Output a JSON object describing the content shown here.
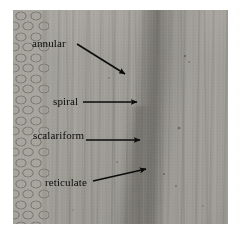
{
  "figure": {
    "kind": "light-micrograph",
    "plate": {
      "left": 13,
      "top": 10,
      "width": 215,
      "height": 214,
      "background_color": "#ffffff",
      "tissue_tone": "#a09e98",
      "dark_band_tone": "#58564f"
    },
    "annotations": {
      "ink_color": "#0b0b0b",
      "callouts": [
        {
          "id": "annular",
          "label": "annular",
          "label_x": 32,
          "label_y": 38,
          "arrow_style": "diagonal-down-right",
          "arrow_start_x": 77,
          "arrow_start_y": 44,
          "arrow_tip_x": 126,
          "arrow_tip_y": 75
        },
        {
          "id": "spiral",
          "label": "spiral",
          "label_x": 53,
          "label_y": 96,
          "arrow_style": "horizontal-right",
          "arrow_start_x": 83,
          "arrow_start_y": 102,
          "arrow_tip_x": 138,
          "arrow_tip_y": 102
        },
        {
          "id": "scalariform",
          "label": "scalariform",
          "label_x": 33,
          "label_y": 130,
          "arrow_style": "horizontal-right",
          "arrow_start_x": 86,
          "arrow_start_y": 140,
          "arrow_tip_x": 141,
          "arrow_tip_y": 140
        },
        {
          "id": "reticulate",
          "label": "reticulate",
          "label_x": 45,
          "label_y": 177,
          "arrow_style": "diagonal-up-right",
          "arrow_start_x": 93,
          "arrow_start_y": 181,
          "arrow_tip_x": 147,
          "arrow_tip_y": 168
        }
      ]
    }
  }
}
